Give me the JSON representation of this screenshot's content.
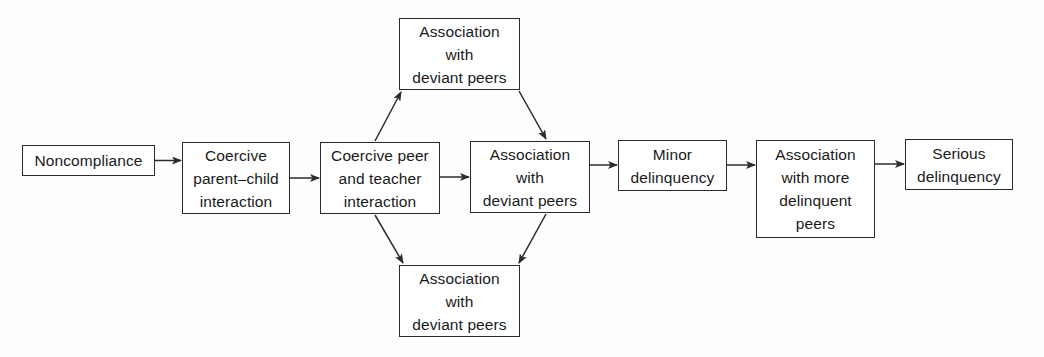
{
  "diagram": {
    "background_color": "#fefefe",
    "stroke_color": "#2b2b2b",
    "text_color": "#1a1a1a",
    "nodes": [
      {
        "id": "noncompliance",
        "lines": [
          "Noncompliance"
        ]
      },
      {
        "id": "coercive_parent",
        "lines": [
          "Coercive",
          "parent–child",
          "interaction"
        ]
      },
      {
        "id": "coercive_peer",
        "lines": [
          "Coercive peer",
          "and teacher",
          "interaction"
        ]
      },
      {
        "id": "deviant_top",
        "lines": [
          "Association",
          "with",
          "deviant peers"
        ]
      },
      {
        "id": "deviant_center",
        "lines": [
          "Association",
          "with",
          "deviant peers"
        ]
      },
      {
        "id": "deviant_bottom",
        "lines": [
          "Association",
          "with",
          "deviant peers"
        ]
      },
      {
        "id": "minor_delinquency",
        "lines": [
          "Minor",
          "delinquency"
        ]
      },
      {
        "id": "more_delinquent",
        "lines": [
          "Association",
          "with more",
          "delinquent",
          "peers"
        ]
      },
      {
        "id": "serious_delinq",
        "lines": [
          "Serious",
          "delinquency"
        ]
      }
    ],
    "edges": [
      {
        "from": "noncompliance",
        "to": "coercive_parent",
        "style": "horizontal-arrow"
      },
      {
        "from": "coercive_parent",
        "to": "coercive_peer",
        "style": "horizontal-arrow"
      },
      {
        "from": "coercive_peer",
        "to": "deviant_center",
        "style": "horizontal-arrow"
      },
      {
        "from": "coercive_peer",
        "to": "deviant_top",
        "style": "diagonal-up-right-arrow"
      },
      {
        "from": "deviant_top",
        "to": "deviant_center",
        "style": "diagonal-down-right-arrow"
      },
      {
        "from": "coercive_peer",
        "to": "deviant_bottom",
        "style": "diagonal-down-right-arrow"
      },
      {
        "from": "deviant_center",
        "to": "deviant_bottom",
        "style": "diagonal-down-left-arrow"
      },
      {
        "from": "deviant_center",
        "to": "minor_delinquency",
        "style": "horizontal-arrow"
      },
      {
        "from": "minor_delinquency",
        "to": "more_delinquent",
        "style": "horizontal-arrow"
      },
      {
        "from": "more_delinquent",
        "to": "serious_delinq",
        "style": "horizontal-arrow"
      }
    ]
  }
}
